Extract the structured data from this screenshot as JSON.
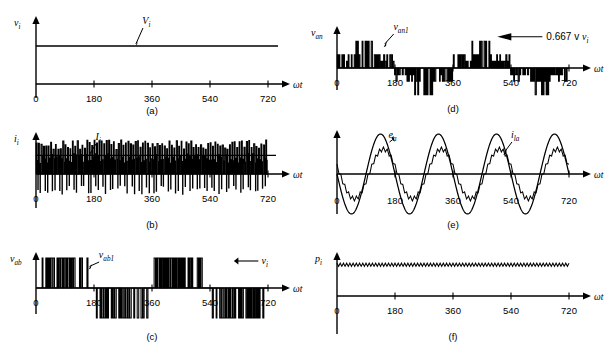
{
  "figure": {
    "width": 604,
    "height": 360,
    "background": "#ffffff",
    "ink": "#000000"
  },
  "axis": {
    "x_label": "ωt",
    "x_ticks": [
      "0",
      "180",
      "360",
      "540",
      "720"
    ],
    "x_tick_values": [
      0,
      180,
      360,
      540,
      720
    ],
    "x_min": 0,
    "x_max": 720
  },
  "panels": [
    {
      "id": "a",
      "caption": "(a)",
      "y_label": "v",
      "y_sub": "i",
      "annotations": [
        {
          "name": "vi-label",
          "text": "V",
          "sub": "i"
        }
      ],
      "chart_data": {
        "type": "line",
        "title": "DC input voltage",
        "xlabel": "ωt",
        "ylabel": "v_i",
        "x": [
          0,
          720
        ],
        "series": [
          {
            "name": "V_i",
            "kind": "constant",
            "value": 1.0,
            "values": [
              1.0,
              1.0
            ]
          }
        ],
        "ylim": [
          0,
          1.25
        ],
        "grid": false,
        "legend": "none"
      }
    },
    {
      "id": "b",
      "caption": "(b)",
      "y_label": "i",
      "y_sub": "i",
      "annotations": [
        {
          "name": "ii-label",
          "text": "I",
          "sub": "i"
        }
      ],
      "chart_data": {
        "type": "line",
        "title": "DC input current (pulsed)",
        "xlabel": "ωt",
        "ylabel": "i_i",
        "xlim": [
          0,
          720
        ],
        "ylim": [
          -0.62,
          1.0
        ],
        "series": [
          {
            "name": "i_i",
            "kind": "pulse-train",
            "pulse_count": 96,
            "positive_peak": 1.0,
            "negative_peak": -0.6,
            "duty": 0.42
          },
          {
            "name": "I_i",
            "kind": "constant",
            "value": 0.55
          }
        ],
        "grid": false,
        "legend": "none"
      }
    },
    {
      "id": "c",
      "caption": "(c)",
      "y_label": "v",
      "y_sub": "ab",
      "annotations": [
        {
          "name": "vab1-label",
          "text": "v",
          "sub": "ab1"
        },
        {
          "name": "vi-arrow-label",
          "text": "v",
          "sub": "i",
          "arrow": "left"
        }
      ],
      "chart_data": {
        "type": "line",
        "title": "Line-to-line PWM voltage",
        "xlabel": "ωt",
        "ylabel": "v_ab",
        "xlim": [
          0,
          720
        ],
        "ylim": [
          -1.0,
          1.0
        ],
        "series": [
          {
            "name": "v_ab",
            "kind": "pwm-bipolar",
            "amplitude": 1.0,
            "carrier_pulses": 60,
            "fundamental_cycles": 2,
            "conduction_deg": 120
          },
          {
            "name": "v_ab1",
            "kind": "sine-fundamental",
            "amplitude": 0.75,
            "cycles": 2
          }
        ],
        "grid": false,
        "legend": "none"
      }
    },
    {
      "id": "d",
      "caption": "(d)",
      "y_label": "v",
      "y_sub": "an",
      "annotations": [
        {
          "name": "van1-label",
          "text": "v",
          "sub": "an1"
        },
        {
          "name": "gain-label",
          "text": "0.667 v",
          "sub": "i",
          "arrow": "left"
        }
      ],
      "chart_data": {
        "type": "line",
        "title": "Phase voltage (six-step PWM)",
        "xlabel": "ωt",
        "ylabel": "v_an",
        "xlim": [
          0,
          720
        ],
        "ylim": [
          -0.72,
          0.72
        ],
        "levels": [
          -0.667,
          -0.333,
          0,
          0.333,
          0.667
        ],
        "series": [
          {
            "name": "v_an",
            "kind": "pwm-multilevel",
            "peak": 0.667,
            "carrier_pulses": 60,
            "fundamental_cycles": 2
          },
          {
            "name": "v_an1",
            "kind": "sine-fundamental",
            "amplitude": 0.5,
            "cycles": 2
          }
        ],
        "grid": false,
        "legend": "none"
      }
    },
    {
      "id": "e",
      "caption": "(e)",
      "y_label": "",
      "y_sub": "",
      "annotations": [
        {
          "name": "ea-label",
          "text": "e",
          "sub": "a"
        },
        {
          "name": "ila-label",
          "text": "i",
          "sub": "la"
        }
      ],
      "chart_data": {
        "type": "line",
        "title": "Back-emf and load current",
        "xlabel": "ωt",
        "ylabel": "",
        "xlim": [
          0,
          720
        ],
        "ylim": [
          -1.05,
          1.05
        ],
        "series": [
          {
            "name": "e_a",
            "kind": "sine",
            "amplitude": 1.0,
            "cycles": 2,
            "phase_deg": 180
          },
          {
            "name": "i_la",
            "kind": "sine-ripple",
            "amplitude": 0.62,
            "cycles": 2,
            "phase_deg": 180,
            "lag_deg": 18,
            "ripple_amplitude": 0.055,
            "ripple_count": 60
          }
        ],
        "grid": false,
        "legend": "none"
      }
    },
    {
      "id": "f",
      "caption": "(f)",
      "y_label": "p",
      "y_sub": "i",
      "annotations": [],
      "chart_data": {
        "type": "line",
        "title": "Input power",
        "xlabel": "ωt",
        "ylabel": "p_i",
        "xlim": [
          0,
          720
        ],
        "ylim": [
          0,
          1.2
        ],
        "series": [
          {
            "name": "p_i",
            "kind": "ripple-constant",
            "mean": 0.92,
            "ripple_amplitude": 0.045,
            "ripple_count": 72
          }
        ],
        "grid": false,
        "legend": "none"
      }
    }
  ]
}
